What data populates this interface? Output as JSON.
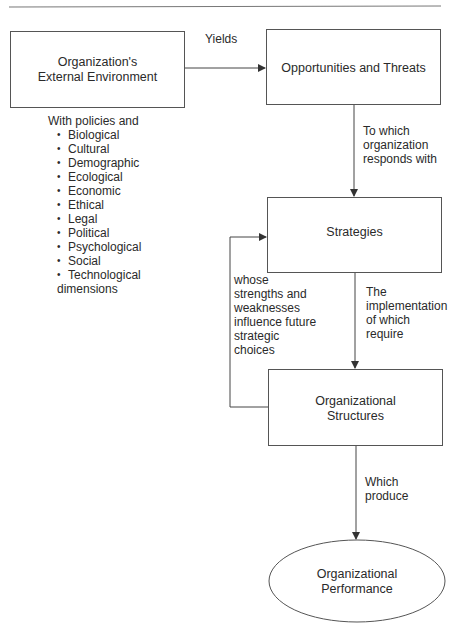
{
  "diagram": {
    "nodes": {
      "external_environment": {
        "line1": "Organization's",
        "line2": "External Environment"
      },
      "opportunities_threats": {
        "label": "Opportunities and Threats"
      },
      "strategies": {
        "label": "Strategies"
      },
      "structures": {
        "line1": "Organizational",
        "line2": "Structures"
      },
      "performance": {
        "line1": "Organizational",
        "line2": "Performance"
      }
    },
    "edges": {
      "yields": "Yields",
      "responds": [
        "To which",
        "organization",
        "responds with"
      ],
      "implementation": [
        "The",
        "implementation",
        "of which",
        "require"
      ],
      "feedback": [
        "whose",
        "strengths and",
        "weaknesses",
        "influence future",
        "strategic",
        "choices"
      ],
      "produce": [
        "Which",
        "produce"
      ]
    },
    "environment_notes": {
      "intro": "With policies and",
      "dimensions": [
        "Biological",
        "Cultural",
        "Demographic",
        "Ecological",
        "Economic",
        "Ethical",
        "Legal",
        "Political",
        "Psychological",
        "Social",
        "Technological"
      ],
      "outro": "dimensions"
    },
    "colors": {
      "line": "#555555",
      "text": "#2a2a2a",
      "background": "#ffffff"
    }
  }
}
